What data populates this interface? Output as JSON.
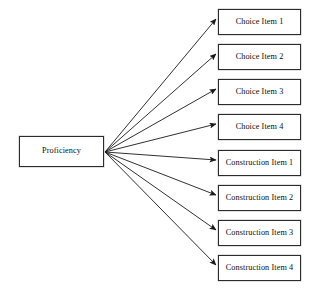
{
  "diagram": {
    "canvas": {
      "width": 317,
      "height": 291,
      "background": "#ffffff"
    },
    "style": {
      "box_border_color": "#2b2b2b",
      "box_fill_color": "#ffffff",
      "arrow_color": "#1a1a1a",
      "text_color": "#0d0d0d"
    },
    "source": {
      "id": "proficiency",
      "label": "Proficiency",
      "x": 19,
      "y": 136,
      "width": 85,
      "height": 31
    },
    "fan_origin": {
      "x": 105,
      "y": 152
    },
    "targets": [
      {
        "id": "choice-item-1",
        "label": "Choice Item 1",
        "x": 218,
        "y": 9,
        "width": 83,
        "height": 26
      },
      {
        "id": "choice-item-2",
        "label": "Choice Item 2",
        "x": 218,
        "y": 44,
        "width": 83,
        "height": 26
      },
      {
        "id": "choice-item-3",
        "label": "Choice Item 3",
        "x": 218,
        "y": 79,
        "width": 83,
        "height": 26
      },
      {
        "id": "choice-item-4",
        "label": "Choice Item 4",
        "x": 218,
        "y": 114,
        "width": 83,
        "height": 26
      },
      {
        "id": "construction-item-1",
        "label": "Construction Item 1",
        "x": 218,
        "y": 150,
        "width": 83,
        "height": 26
      },
      {
        "id": "construction-item-2",
        "label": "Construction Item 2",
        "x": 218,
        "y": 185,
        "width": 83,
        "height": 26
      },
      {
        "id": "construction-item-3",
        "label": "Construction Item 3",
        "x": 218,
        "y": 220,
        "width": 83,
        "height": 26
      },
      {
        "id": "construction-item-4",
        "label": "Construction Item 4",
        "x": 218,
        "y": 255,
        "width": 83,
        "height": 26
      }
    ],
    "edges": [
      {
        "from": "proficiency",
        "to": "choice-item-1",
        "arrowhead": "filled-triangle"
      },
      {
        "from": "proficiency",
        "to": "choice-item-2",
        "arrowhead": "filled-triangle"
      },
      {
        "from": "proficiency",
        "to": "choice-item-3",
        "arrowhead": "filled-triangle"
      },
      {
        "from": "proficiency",
        "to": "choice-item-4",
        "arrowhead": "filled-triangle"
      },
      {
        "from": "proficiency",
        "to": "construction-item-1",
        "arrowhead": "filled-triangle"
      },
      {
        "from": "proficiency",
        "to": "construction-item-2",
        "arrowhead": "filled-triangle"
      },
      {
        "from": "proficiency",
        "to": "construction-item-3",
        "arrowhead": "filled-triangle"
      },
      {
        "from": "proficiency",
        "to": "construction-item-4",
        "arrowhead": "filled-triangle"
      }
    ]
  }
}
